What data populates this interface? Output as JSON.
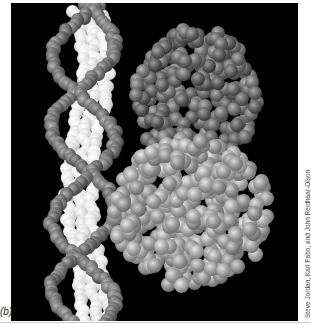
{
  "figure": {
    "panel_label": "(b)",
    "credit": "Steve Jordan, Karl Pabo, and John Reidhaar-Olson",
    "colors": {
      "background": "#000000",
      "dna_backbone": "#6e6e6e",
      "dna_bases": "#e8e8e8",
      "protein_dark": "#5a5a5a",
      "protein_light": "#9a9a9a"
    }
  }
}
